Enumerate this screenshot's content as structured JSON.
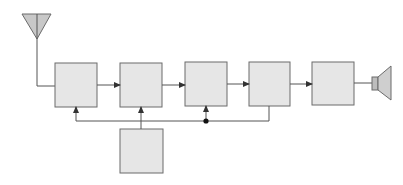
{
  "diagram": {
    "type": "block-diagram",
    "colors": {
      "block_fill": "#e6e6e6",
      "block_stroke": "#6b6b6b",
      "line": "#555555",
      "antenna_fill": "#c8c8c8",
      "speaker_fill": "#cfcfcf"
    },
    "nodes": [
      {
        "id": "antenna",
        "kind": "antenna-icon",
        "label": ""
      },
      {
        "id": "block1",
        "kind": "block",
        "label": ""
      },
      {
        "id": "block2",
        "kind": "block",
        "label": ""
      },
      {
        "id": "block3",
        "kind": "block",
        "label": ""
      },
      {
        "id": "block4",
        "kind": "block",
        "label": ""
      },
      {
        "id": "block5",
        "kind": "block",
        "label": ""
      },
      {
        "id": "block6",
        "kind": "block",
        "label": ""
      },
      {
        "id": "speaker",
        "kind": "speaker-icon",
        "label": ""
      }
    ],
    "edges": [
      {
        "from": "antenna",
        "to": "block1"
      },
      {
        "from": "block1",
        "to": "block2",
        "arrow": true
      },
      {
        "from": "block2",
        "to": "block3",
        "arrow": true
      },
      {
        "from": "block3",
        "to": "block4",
        "arrow": true
      },
      {
        "from": "block4",
        "to": "block5",
        "arrow": true
      },
      {
        "from": "block5",
        "to": "speaker"
      },
      {
        "from": "block4",
        "to": "block1",
        "arrow": true,
        "kind": "feedback"
      },
      {
        "from": "block4",
        "to": "block3",
        "arrow": true,
        "kind": "feedback",
        "junction": true
      },
      {
        "from": "block6",
        "to": "block2",
        "arrow": true
      }
    ]
  }
}
